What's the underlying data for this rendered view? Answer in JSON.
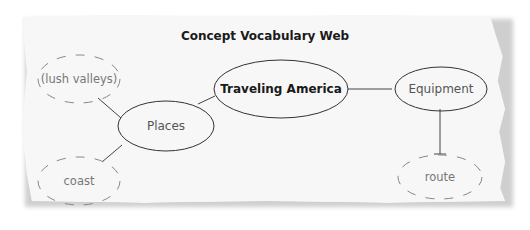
{
  "title": "Concept Vocabulary Web",
  "nodes": {
    "center": {
      "label": "Traveling America",
      "style": "solid-bold"
    },
    "places": {
      "label": "Places",
      "style": "solid"
    },
    "equipment": {
      "label": "Equipment",
      "style": "solid"
    },
    "lush_valleys": {
      "label": "(lush valleys)",
      "style": "dashed"
    },
    "coast": {
      "label": "coast",
      "style": "dashed"
    },
    "route": {
      "label": "route",
      "style": "dashed"
    }
  },
  "edges": [
    [
      "center",
      "places"
    ],
    [
      "center",
      "equipment"
    ],
    [
      "places",
      "lush_valleys"
    ],
    [
      "places",
      "coast"
    ],
    [
      "equipment",
      "route"
    ]
  ],
  "colors": {
    "paper": "#f7f7f7",
    "stroke": "#333333",
    "dashed_stroke": "#888888",
    "title_text": "#1a1a1a"
  }
}
